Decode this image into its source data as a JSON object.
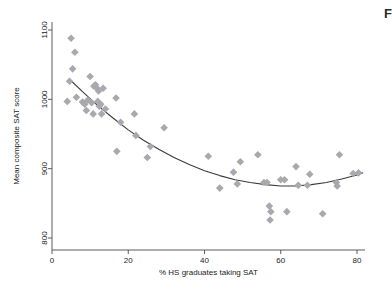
{
  "figure": {
    "background_color": "#ffffff",
    "corner_text": "F"
  },
  "chart_data": {
    "type": "scatter",
    "title": "",
    "subtitle": "",
    "xlabel": "% HS graduates taking SAT",
    "ylabel": "Mean composite SAT score",
    "xlim": [
      0,
      84
    ],
    "ylim": [
      780,
      1110
    ],
    "xticks": [
      0,
      20,
      40,
      60,
      80
    ],
    "yticks": [
      800,
      900,
      1000,
      1100
    ],
    "xtick_labels": [
      "0",
      "20",
      "40",
      "60",
      "80"
    ],
    "ytick_labels": [
      "800",
      "900",
      "1000",
      "1100"
    ],
    "grid": false,
    "legend": false,
    "legend_position": "none",
    "marker_shape": "diamond",
    "marker_color": "#a8a8ae",
    "marker_size": 5,
    "fit_line": {
      "name": "quadratic fit",
      "color": "#3b3b3b",
      "width": 1.1,
      "points": [
        {
          "x": 4.6,
          "y": 1029
        },
        {
          "x": 8,
          "y": 1011
        },
        {
          "x": 12,
          "y": 991
        },
        {
          "x": 16,
          "y": 973
        },
        {
          "x": 20,
          "y": 956
        },
        {
          "x": 24,
          "y": 941
        },
        {
          "x": 28,
          "y": 928
        },
        {
          "x": 32,
          "y": 916
        },
        {
          "x": 36,
          "y": 906
        },
        {
          "x": 40,
          "y": 897
        },
        {
          "x": 44,
          "y": 890
        },
        {
          "x": 48,
          "y": 884
        },
        {
          "x": 52,
          "y": 880
        },
        {
          "x": 56,
          "y": 877
        },
        {
          "x": 60,
          "y": 875
        },
        {
          "x": 64,
          "y": 875
        },
        {
          "x": 68,
          "y": 877
        },
        {
          "x": 72,
          "y": 880
        },
        {
          "x": 76,
          "y": 885
        },
        {
          "x": 80,
          "y": 891
        },
        {
          "x": 81.5,
          "y": 894
        }
      ]
    },
    "points": [
      {
        "x": 4.0,
        "y": 997
      },
      {
        "x": 4.6,
        "y": 1026
      },
      {
        "x": 5.0,
        "y": 1088
      },
      {
        "x": 5.4,
        "y": 1044
      },
      {
        "x": 6.0,
        "y": 1068
      },
      {
        "x": 6.4,
        "y": 1003
      },
      {
        "x": 8.0,
        "y": 996
      },
      {
        "x": 8.6,
        "y": 993
      },
      {
        "x": 9.0,
        "y": 984
      },
      {
        "x": 9.4,
        "y": 999
      },
      {
        "x": 10.0,
        "y": 1033
      },
      {
        "x": 10.4,
        "y": 995
      },
      {
        "x": 10.8,
        "y": 979
      },
      {
        "x": 11.0,
        "y": 1019
      },
      {
        "x": 11.4,
        "y": 1021
      },
      {
        "x": 11.8,
        "y": 1016
      },
      {
        "x": 12.0,
        "y": 997
      },
      {
        "x": 12.2,
        "y": 1012
      },
      {
        "x": 12.4,
        "y": 990
      },
      {
        "x": 12.8,
        "y": 993
      },
      {
        "x": 13.0,
        "y": 979
      },
      {
        "x": 13.4,
        "y": 1016
      },
      {
        "x": 14.0,
        "y": 986
      },
      {
        "x": 16.8,
        "y": 1002
      },
      {
        "x": 17.0,
        "y": 925
      },
      {
        "x": 18.0,
        "y": 967
      },
      {
        "x": 21.6,
        "y": 979
      },
      {
        "x": 22.0,
        "y": 948
      },
      {
        "x": 25.0,
        "y": 916
      },
      {
        "x": 25.8,
        "y": 932
      },
      {
        "x": 29.4,
        "y": 959
      },
      {
        "x": 41.0,
        "y": 918
      },
      {
        "x": 44.0,
        "y": 872
      },
      {
        "x": 47.6,
        "y": 895
      },
      {
        "x": 48.6,
        "y": 878
      },
      {
        "x": 49.4,
        "y": 910
      },
      {
        "x": 54.0,
        "y": 920
      },
      {
        "x": 55.6,
        "y": 880
      },
      {
        "x": 56.4,
        "y": 880
      },
      {
        "x": 57.0,
        "y": 846
      },
      {
        "x": 57.2,
        "y": 826
      },
      {
        "x": 57.4,
        "y": 838
      },
      {
        "x": 60.0,
        "y": 884
      },
      {
        "x": 61.0,
        "y": 884
      },
      {
        "x": 61.6,
        "y": 838
      },
      {
        "x": 64.0,
        "y": 903
      },
      {
        "x": 64.6,
        "y": 876
      },
      {
        "x": 67.0,
        "y": 876
      },
      {
        "x": 67.6,
        "y": 892
      },
      {
        "x": 71.0,
        "y": 835
      },
      {
        "x": 74.6,
        "y": 880
      },
      {
        "x": 74.8,
        "y": 875
      },
      {
        "x": 75.4,
        "y": 920
      },
      {
        "x": 79.0,
        "y": 893
      },
      {
        "x": 80.4,
        "y": 894
      }
    ]
  }
}
